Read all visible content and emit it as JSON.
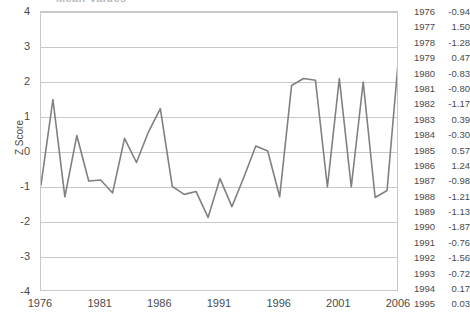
{
  "chart_title": "Mean Values",
  "axis": {
    "y_title": "Z Score",
    "y_ticks": [
      "4",
      "3",
      "2",
      "1",
      "0",
      "-1",
      "-2",
      "-3",
      "-4"
    ],
    "y_min": -4,
    "y_max": 4,
    "x_ticks": [
      "1976",
      "1981",
      "1986",
      "1991",
      "1996",
      "2001",
      "2006"
    ],
    "x_min": 1976,
    "x_max": 2006
  },
  "colors": {
    "line": "#808080",
    "gridline": "#c8c8c8",
    "text": "#4a4a4a",
    "background": "#ffffff"
  },
  "table": {
    "rows": [
      {
        "year": "1976",
        "value": "-0.94"
      },
      {
        "year": "1977",
        "value": "1.50"
      },
      {
        "year": "1978",
        "value": "-1.28"
      },
      {
        "year": "1979",
        "value": "0.47"
      },
      {
        "year": "1980",
        "value": "-0.83"
      },
      {
        "year": "1981",
        "value": "-0.80"
      },
      {
        "year": "1982",
        "value": "-1.17"
      },
      {
        "year": "1983",
        "value": "0.39"
      },
      {
        "year": "1984",
        "value": "-0.30"
      },
      {
        "year": "1985",
        "value": "0.57"
      },
      {
        "year": "1986",
        "value": "1.24"
      },
      {
        "year": "1987",
        "value": "-0.98"
      },
      {
        "year": "1988",
        "value": "-1.21"
      },
      {
        "year": "1989",
        "value": "-1.13"
      },
      {
        "year": "1990",
        "value": "-1.87"
      },
      {
        "year": "1991",
        "value": "-0.76"
      },
      {
        "year": "1992",
        "value": "-1.56"
      },
      {
        "year": "1993",
        "value": "-0.72"
      },
      {
        "year": "1994",
        "value": "0.17"
      },
      {
        "year": "1995",
        "value": "0.03"
      }
    ]
  },
  "chart_data": {
    "type": "line",
    "title": "Mean Values",
    "xlabel": "",
    "ylabel": "Z Score",
    "ylim": [
      -4,
      4
    ],
    "xlim": [
      1976,
      2006
    ],
    "grid": true,
    "legend": "none",
    "x": [
      1976,
      1977,
      1978,
      1979,
      1980,
      1981,
      1982,
      1983,
      1984,
      1985,
      1986,
      1987,
      1988,
      1989,
      1990,
      1991,
      1992,
      1993,
      1994,
      1995,
      1996,
      1997,
      1998,
      1999,
      2000,
      2001,
      2002,
      2003,
      2004,
      2005,
      2006
    ],
    "series": [
      {
        "name": "Z Score",
        "values": [
          -0.94,
          1.5,
          -1.28,
          0.47,
          -0.83,
          -0.8,
          -1.17,
          0.39,
          -0.3,
          0.57,
          1.24,
          -0.98,
          -1.21,
          -1.13,
          -1.87,
          -0.76,
          -1.56,
          -0.72,
          0.17,
          0.03,
          -1.28,
          1.9,
          2.1,
          2.05,
          -1.0,
          2.1,
          -1.0,
          2.0,
          -1.3,
          -1.1,
          2.85
        ]
      }
    ]
  }
}
